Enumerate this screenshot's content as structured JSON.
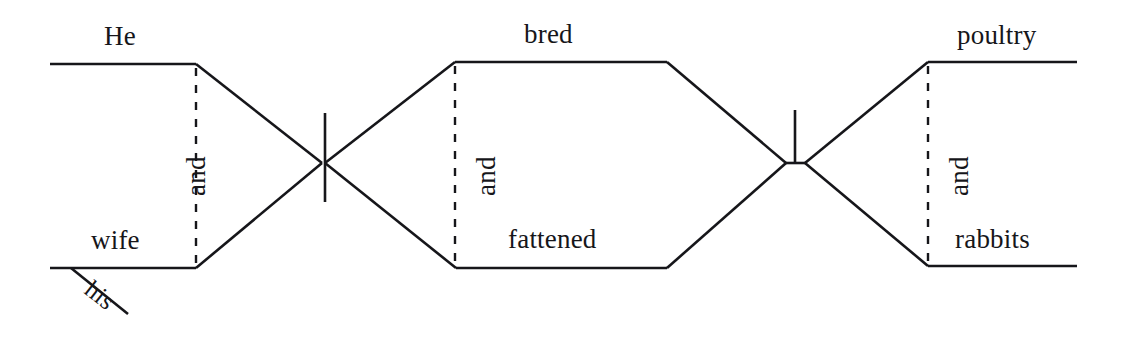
{
  "diagram": {
    "kind": "reed-kellogg-sentence-diagram",
    "sentence": "He and his wife bred and fattened poultry and rabbits.",
    "ink_color": "#16161a",
    "background_color": "#ffffff",
    "labels": {
      "subject_top": "He",
      "subject_bottom": "wife",
      "subject_conjunction": "and",
      "subject_modifier": "his",
      "verb_top": "bred",
      "verb_bottom": "fattened",
      "verb_conjunction": "and",
      "object_top": "poultry",
      "object_bottom": "rabbits",
      "object_conjunction": "and"
    },
    "parts": [
      {
        "role": "subject",
        "words": [
          "He",
          "wife"
        ],
        "conjunction": "and",
        "modifier": "his"
      },
      {
        "role": "predicate",
        "words": [
          "bred",
          "fattened"
        ],
        "conjunction": "and"
      },
      {
        "role": "direct-object",
        "words": [
          "poultry",
          "rabbits"
        ],
        "conjunction": "and"
      }
    ]
  }
}
